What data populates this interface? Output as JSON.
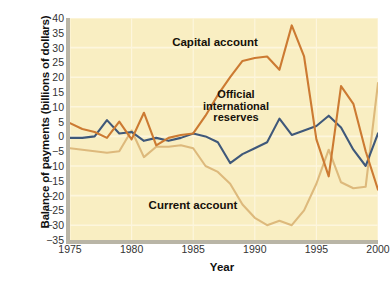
{
  "chart_data": {
    "type": "line",
    "title": "",
    "xlabel": "Year",
    "ylabel": "Balance of payments (billions of dollars)",
    "xlim": [
      1975,
      2000
    ],
    "ylim": [
      -35,
      40
    ],
    "ytick_step": 5,
    "grid": "horizontal-faint",
    "legend_position": "in-plot-annotations",
    "background_color": "#f9eec2",
    "x": [
      1975,
      1976,
      1977,
      1978,
      1979,
      1980,
      1981,
      1982,
      1983,
      1984,
      1985,
      1986,
      1987,
      1988,
      1989,
      1990,
      1991,
      1992,
      1993,
      1994,
      1995,
      1996,
      1997,
      1998,
      1999,
      2000
    ],
    "xticks": [
      1975,
      1980,
      1985,
      1990,
      1995,
      2000
    ],
    "yticks": [
      40,
      35,
      30,
      25,
      20,
      15,
      10,
      5,
      0,
      -5,
      -10,
      -15,
      -20,
      -25,
      -30,
      -35
    ],
    "series": [
      {
        "name": "Capital account",
        "color": "#cc7a32",
        "values": [
          4.5,
          2.5,
          1.5,
          -0.5,
          5,
          -1,
          8,
          -3,
          -0.5,
          0.5,
          1,
          7,
          14,
          20,
          25.5,
          26.5,
          27,
          22.5,
          37.5,
          27,
          -1,
          -13.5,
          17,
          11,
          -5,
          -18
        ]
      },
      {
        "name": "Official international reserves",
        "color": "#3f587a",
        "values": [
          -0.5,
          -0.5,
          0,
          5.5,
          1,
          1.5,
          -1.5,
          -0.5,
          -1.5,
          -0.5,
          1,
          0,
          -2,
          -9,
          -6,
          -4,
          -2,
          6,
          0.5,
          2,
          3.5,
          7,
          3,
          -4.5,
          -10,
          1
        ]
      },
      {
        "name": "Current account",
        "color": "#ddb97c",
        "values": [
          -4,
          -4.5,
          -5,
          -5.5,
          -5,
          2,
          -7,
          -3.5,
          -3.5,
          -3,
          -4,
          -10,
          -12,
          -16,
          -23,
          -27.5,
          -30,
          -28.5,
          -30,
          -25,
          -16,
          -4.5,
          -15.5,
          -17.5,
          -17,
          18
        ]
      }
    ]
  },
  "annotations": {
    "capital_account": "Capital account",
    "official_reserves": "Official\ninternational\nreserves",
    "current_account": "Current account"
  },
  "caption": {
    "text": ""
  }
}
